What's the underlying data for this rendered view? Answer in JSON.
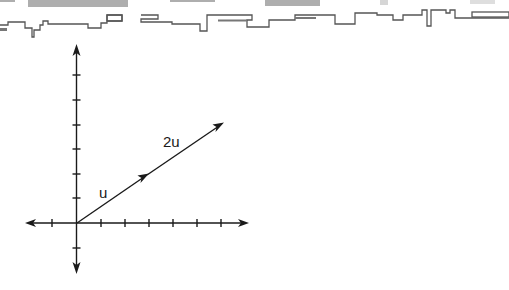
{
  "header_strip": {
    "description": "torn scanned page edge",
    "edge_color": "#555555",
    "smudge_color": "#9a9a9a"
  },
  "diagram": {
    "type": "vector-plot",
    "axes": {
      "x_ticks": [
        -1,
        1,
        2,
        3,
        4,
        5,
        6
      ],
      "y_ticks": [
        -1,
        1,
        2,
        3,
        4,
        5,
        6
      ],
      "x_arrows": "both",
      "y_arrows": "both",
      "color": "#1a1a1a"
    },
    "vectors": [
      {
        "name": "u",
        "label": "u",
        "from": [
          0,
          0
        ],
        "to": [
          3,
          2
        ]
      },
      {
        "name": "2u",
        "label": "2u",
        "from": [
          3,
          2
        ],
        "to": [
          6,
          4
        ]
      }
    ]
  }
}
